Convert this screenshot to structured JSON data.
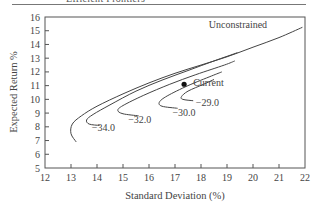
{
  "header": {
    "caption": "Efficient Frontiers"
  },
  "chart_data": {
    "type": "line",
    "title": "",
    "xlabel": "Standard Deviation (%)",
    "ylabel": "Expected Return %",
    "xlim": [
      12,
      22
    ],
    "ylim": [
      5,
      16
    ],
    "xticks": [
      12,
      13,
      14,
      15,
      16,
      17,
      18,
      19,
      20,
      21,
      22
    ],
    "yticks": [
      5,
      6,
      7,
      8,
      9,
      10,
      11,
      12,
      13,
      14,
      15,
      16
    ],
    "grid": false,
    "legend": "none (inline labels)",
    "series": [
      {
        "name": "Unconstrained",
        "label": "Unconstrained",
        "label_pos": [
          18.3,
          15.2
        ],
        "points": [
          [
            13.2,
            6.9
          ],
          [
            13.0,
            7.5
          ],
          [
            13.05,
            8.2
          ],
          [
            13.4,
            8.8
          ],
          [
            14.0,
            9.5
          ],
          [
            15.0,
            10.4
          ],
          [
            16.0,
            11.2
          ],
          [
            17.0,
            11.9
          ],
          [
            18.0,
            12.5
          ],
          [
            19.0,
            13.1
          ],
          [
            20.0,
            13.8
          ],
          [
            21.0,
            14.5
          ],
          [
            21.9,
            15.25
          ]
        ]
      },
      {
        "name": "-34.0",
        "label": "−34.0",
        "label_pos": [
          13.8,
          7.7
        ],
        "points": [
          [
            14.1,
            8.1
          ],
          [
            13.7,
            8.2
          ],
          [
            13.6,
            8.5
          ],
          [
            13.85,
            8.9
          ],
          [
            14.5,
            9.6
          ],
          [
            15.5,
            10.6
          ],
          [
            16.5,
            11.4
          ],
          [
            17.5,
            12.1
          ],
          [
            18.5,
            12.8
          ],
          [
            19.4,
            13.4
          ]
        ]
      },
      {
        "name": "-32.0",
        "label": "−32.0",
        "label_pos": [
          15.2,
          8.3
        ],
        "points": [
          [
            15.6,
            8.8
          ],
          [
            15.0,
            8.95
          ],
          [
            14.8,
            9.2
          ],
          [
            15.0,
            9.55
          ],
          [
            15.8,
            10.3
          ],
          [
            16.8,
            11.1
          ],
          [
            17.8,
            11.8
          ],
          [
            18.9,
            12.5
          ],
          [
            19.3,
            12.8
          ]
        ]
      },
      {
        "name": "-30.0",
        "label": "−30.0",
        "label_pos": [
          16.9,
          8.8
        ],
        "points": [
          [
            17.1,
            9.35
          ],
          [
            16.5,
            9.5
          ],
          [
            16.4,
            9.8
          ],
          [
            16.7,
            10.25
          ],
          [
            17.5,
            11.0
          ],
          [
            18.4,
            11.7
          ],
          [
            18.8,
            12.0
          ]
        ]
      },
      {
        "name": "-29.0",
        "label": "−29.0",
        "label_pos": [
          17.8,
          9.5
        ],
        "points": [
          [
            17.7,
            9.9
          ],
          [
            17.3,
            10.0
          ],
          [
            17.25,
            10.2
          ],
          [
            17.5,
            10.6
          ],
          [
            18.1,
            11.1
          ],
          [
            18.5,
            11.45
          ]
        ]
      }
    ],
    "annotations": [
      {
        "type": "point",
        "label": "Current",
        "x": 17.35,
        "y": 11.1,
        "label_pos": [
          17.7,
          11.0
        ]
      }
    ]
  }
}
